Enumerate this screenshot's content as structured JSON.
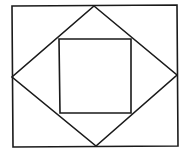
{
  "diagram": {
    "type": "nested-shapes",
    "stroke_color": "#1a1a1a",
    "background": "#ffffff",
    "stroke_width": 1.6,
    "outer_rectangle": {
      "points": "12,6 177,5 178,146 13,147"
    },
    "diamond": {
      "points": "94,6 177,75 96,146 12,77"
    },
    "inner_square": {
      "points": "59,39 131,39 131,113 60,113"
    }
  }
}
